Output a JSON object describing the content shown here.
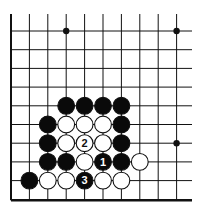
{
  "board": {
    "origin_x": 11,
    "origin_y": 31,
    "spacing_x": 18.4,
    "spacing_y": 18.7,
    "cols": 11,
    "rows": 10,
    "top_y": 14,
    "right_x": 192,
    "line_color": "#111111"
  },
  "star_points": [
    [
      3,
      0
    ],
    [
      9,
      0
    ],
    [
      9,
      6
    ]
  ],
  "stones": [
    {
      "col": 3,
      "row": 4,
      "color": "black"
    },
    {
      "col": 4,
      "row": 4,
      "color": "black"
    },
    {
      "col": 5,
      "row": 4,
      "color": "black"
    },
    {
      "col": 6,
      "row": 4,
      "color": "black"
    },
    {
      "col": 2,
      "row": 5,
      "color": "black"
    },
    {
      "col": 3,
      "row": 5,
      "color": "white"
    },
    {
      "col": 4,
      "row": 5,
      "color": "white"
    },
    {
      "col": 5,
      "row": 5,
      "color": "white"
    },
    {
      "col": 6,
      "row": 5,
      "color": "black"
    },
    {
      "col": 2,
      "row": 6,
      "color": "black"
    },
    {
      "col": 3,
      "row": 6,
      "color": "white"
    },
    {
      "col": 4,
      "row": 6,
      "color": "white",
      "label": "2"
    },
    {
      "col": 5,
      "row": 6,
      "color": "white"
    },
    {
      "col": 6,
      "row": 6,
      "color": "black"
    },
    {
      "col": 2,
      "row": 7,
      "color": "black"
    },
    {
      "col": 3,
      "row": 7,
      "color": "black"
    },
    {
      "col": 4,
      "row": 7,
      "color": "white"
    },
    {
      "col": 5,
      "row": 7,
      "color": "black",
      "label": "1"
    },
    {
      "col": 6,
      "row": 7,
      "color": "black"
    },
    {
      "col": 7,
      "row": 7,
      "color": "white"
    },
    {
      "col": 1,
      "row": 8,
      "color": "black"
    },
    {
      "col": 2,
      "row": 8,
      "color": "white"
    },
    {
      "col": 3,
      "row": 8,
      "color": "white"
    },
    {
      "col": 4,
      "row": 8,
      "color": "black",
      "label": "3"
    },
    {
      "col": 5,
      "row": 8,
      "color": "white"
    },
    {
      "col": 6,
      "row": 8,
      "color": "white"
    }
  ]
}
